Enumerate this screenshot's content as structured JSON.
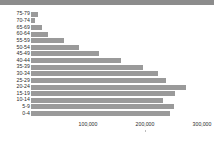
{
  "chart_data": {
    "type": "bar",
    "orientation": "horizontal",
    "title": "",
    "xlabel": "",
    "ylabel": "",
    "categories": [
      "75-79",
      "70-74",
      "65-69",
      "60-64",
      "55-59",
      "50-54",
      "45-49",
      "40-44",
      "35-39",
      "30-34",
      "25-29",
      "20-24",
      "15-19",
      "10-14",
      "5-9",
      "0-4"
    ],
    "values": [
      12000,
      7000,
      19000,
      29000,
      58000,
      84000,
      119000,
      158000,
      196000,
      222000,
      237000,
      272000,
      252000,
      232000,
      250000,
      244000
    ],
    "xlim": [
      0,
      320000
    ],
    "xticks": [
      100000,
      200000,
      300000
    ],
    "xtick_labels": [
      "100,000",
      "200,000",
      "300,000"
    ],
    "grid": false,
    "legend": false,
    "bar_color": "#9a9a9a",
    "band_color": "#8c8c8c",
    "text_color": "#2b2b2b",
    "background": "#ffffff"
  }
}
